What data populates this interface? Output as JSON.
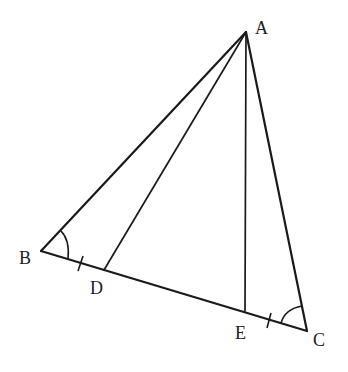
{
  "diagram": {
    "type": "geometry-triangle",
    "points": {
      "A": {
        "label": "A",
        "x": 246,
        "y": 32
      },
      "B": {
        "label": "B",
        "x": 41,
        "y": 251
      },
      "C": {
        "label": "C",
        "x": 307,
        "y": 331
      },
      "D": {
        "label": "D",
        "x": 104,
        "y": 270
      },
      "E": {
        "label": "E",
        "x": 245,
        "y": 311
      }
    },
    "segments": [
      "AB",
      "AC",
      "BC",
      "AD",
      "AE"
    ],
    "equal_marks": [
      "BD",
      "EC"
    ],
    "angle_marks": [
      "B",
      "C"
    ],
    "stroke_color": "#1a1a1a"
  }
}
